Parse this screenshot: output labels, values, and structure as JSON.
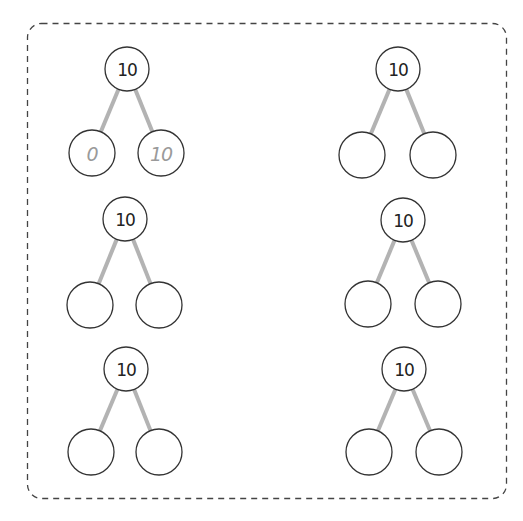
{
  "worksheet": {
    "border": {
      "style": "dashed",
      "color": "#444444"
    },
    "colors": {
      "circle_stroke": "#333333",
      "connector": "#b3b3b3",
      "answer_text": "#9a9a9a",
      "number_text": "#222222"
    },
    "bonds": [
      {
        "id": "bond-1",
        "whole": "10",
        "left_part": "0",
        "right_part": "10",
        "is_example": true,
        "top": [
          127,
          69
        ],
        "left": [
          92,
          153
        ],
        "right": [
          161,
          153
        ]
      },
      {
        "id": "bond-2",
        "whole": "10",
        "left_part": "",
        "right_part": "",
        "is_example": false,
        "top": [
          398,
          69
        ],
        "left": [
          362,
          155
        ],
        "right": [
          433,
          155
        ]
      },
      {
        "id": "bond-3",
        "whole": "10",
        "left_part": "",
        "right_part": "",
        "is_example": false,
        "top": [
          125,
          219
        ],
        "left": [
          90,
          305
        ],
        "right": [
          159,
          305
        ]
      },
      {
        "id": "bond-4",
        "whole": "10",
        "left_part": "",
        "right_part": "",
        "is_example": false,
        "top": [
          403,
          220
        ],
        "left": [
          368,
          304
        ],
        "right": [
          438,
          304
        ]
      },
      {
        "id": "bond-5",
        "whole": "10",
        "left_part": "",
        "right_part": "",
        "is_example": false,
        "top": [
          126,
          369
        ],
        "left": [
          91,
          452
        ],
        "right": [
          159,
          452
        ]
      },
      {
        "id": "bond-6",
        "whole": "10",
        "left_part": "",
        "right_part": "",
        "is_example": false,
        "top": [
          404,
          369
        ],
        "left": [
          369,
          452
        ],
        "right": [
          439,
          452
        ]
      }
    ]
  }
}
